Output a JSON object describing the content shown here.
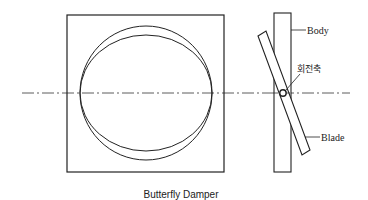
{
  "diagram": {
    "caption": "Butterfly Damper",
    "labels": {
      "body": "Body",
      "axis": "회전축",
      "blade": "Blade"
    },
    "views": [
      "front-view",
      "side-view"
    ]
  }
}
